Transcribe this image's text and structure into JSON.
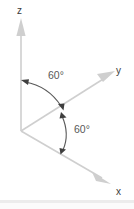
{
  "figure": {
    "kind": "3d-coordinate-axes-diagram",
    "background_color": "#ffffff",
    "axis_color": "#c9c9c9",
    "arc_color": "#4a4a4a",
    "label_color": "#3b3b3b",
    "angle_label_color": "#585858",
    "divider_color": "#ececec"
  },
  "axes": {
    "z": {
      "label": "z"
    },
    "y": {
      "label": "y"
    },
    "x": {
      "label": "x"
    }
  },
  "angles": {
    "upper": {
      "label": "60°",
      "value": 60,
      "unit": "degrees",
      "between": "z-axis and mid-direction"
    },
    "lower": {
      "label": "60°",
      "value": 60,
      "unit": "degrees",
      "between": "mid-direction and x-axis"
    }
  },
  "icons": {
    "z_arrow": "arrow-up-icon",
    "y_arrow": "arrow-upright-icon",
    "x_arrow": "arrow-downright-icon",
    "upper_arc": "double-headed-arc-arrow-icon",
    "lower_arc": "double-headed-arc-arrow-icon"
  }
}
